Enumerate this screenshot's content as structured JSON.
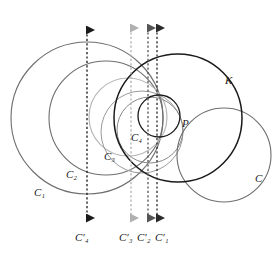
{
  "figure": {
    "width": 279,
    "height": 253,
    "background": "#ffffff"
  },
  "palette": {
    "black": "#1a1a1a",
    "dark_gray": "#444444",
    "mid_gray": "#6e6e6e",
    "gray": "#8a8a8a",
    "light_gray": "#b8b8b8",
    "very_light_gray": "#cfcfcf",
    "white": "#ffffff"
  },
  "labels": [
    {
      "id": "C1",
      "base": "C",
      "sub": "1",
      "prime": false,
      "x": 40,
      "y": 192,
      "color": "#555555"
    },
    {
      "id": "C2",
      "base": "C",
      "sub": "2",
      "prime": false,
      "x": 72,
      "y": 174,
      "color": "#555555"
    },
    {
      "id": "C3",
      "base": "C",
      "sub": "3",
      "prime": false,
      "x": 110,
      "y": 156,
      "color": "#8a8a8a"
    },
    {
      "id": "C4",
      "base": "C",
      "sub": "4",
      "prime": false,
      "x": 136,
      "y": 137,
      "color": "#1a1a1a"
    },
    {
      "id": "K",
      "base": "K",
      "sub": "",
      "prime": false,
      "x": 229,
      "y": 80,
      "color": "#1a1a1a"
    },
    {
      "id": "C",
      "base": "C",
      "sub": "",
      "prime": false,
      "x": 259,
      "y": 178,
      "color": "#1a1a1a"
    },
    {
      "id": "P",
      "base": "P",
      "sub": "",
      "prime": false,
      "x": 185,
      "y": 124,
      "color": "#1a1a1a"
    },
    {
      "id": "C4prime",
      "base": "C",
      "sub": "4",
      "prime": true,
      "x": 81,
      "y": 238,
      "color": "#1a1a1a"
    },
    {
      "id": "C3prime",
      "base": "C",
      "sub": "3",
      "prime": true,
      "x": 125,
      "y": 238,
      "color": "#8a8a8a"
    },
    {
      "id": "C2prime",
      "base": "C",
      "sub": "2",
      "prime": true,
      "x": 143,
      "y": 238,
      "color": "#444444"
    },
    {
      "id": "C1prime",
      "base": "C",
      "sub": "1",
      "prime": true,
      "x": 160,
      "y": 238,
      "color": "#1a1a1a"
    }
  ],
  "label_text": {
    "C1": "C₁",
    "C2": "C₂",
    "C3": "C₃",
    "C4": "C₄",
    "K": "K",
    "C": "C",
    "P": "P",
    "C4prime": "C′₄",
    "C3prime": "C′₃",
    "C2prime": "C′₂",
    "C1prime": "C′₁"
  },
  "circles": [
    {
      "id": "C1",
      "cx": 87,
      "cy": 118,
      "r": 76,
      "stroke": "#6e6e6e",
      "width": 1.1
    },
    {
      "id": "C2",
      "cx": 106,
      "cy": 118,
      "r": 57,
      "stroke": "#6e6e6e",
      "width": 1.1
    },
    {
      "id": "C3",
      "cx": 128,
      "cy": 117,
      "r": 39,
      "stroke": "#b8b8b8",
      "width": 1.2
    },
    {
      "id": "C4",
      "cx": 159,
      "cy": 116,
      "r": 21,
      "stroke": "#1a1a1a",
      "width": 1.3
    },
    {
      "id": "K",
      "cx": 178,
      "cy": 118,
      "r": 64,
      "stroke": "#1a1a1a",
      "width": 1.5
    },
    {
      "id": "C",
      "cx": 224,
      "cy": 155,
      "r": 47,
      "stroke": "#6e6e6e",
      "width": 1.1
    },
    {
      "id": "K-inner-arc-a",
      "cx": 150,
      "cy": 130,
      "r": 33,
      "stroke": "#8a8a8a",
      "width": 1.0
    },
    {
      "id": "K-inner-arc-b",
      "cx": 142,
      "cy": 132,
      "r": 41,
      "stroke": "#9a9a9a",
      "width": 1.0
    }
  ],
  "image_lines": [
    {
      "id": "C4prime-line",
      "x": 87,
      "y_top": 24,
      "y_bottom": 224,
      "color": "#1a1a1a",
      "label": "C4prime"
    },
    {
      "id": "C3prime-line",
      "x": 131,
      "y_top": 22,
      "y_bottom": 224,
      "color": "#b0b0b0",
      "label": "C3prime"
    },
    {
      "id": "C2prime-line",
      "x": 148,
      "y_top": 22,
      "y_bottom": 224,
      "color": "#555555",
      "label": "C2prime"
    },
    {
      "id": "C1prime-line",
      "x": 157,
      "y_top": 22,
      "y_bottom": 224,
      "color": "#2b2b2b",
      "label": "C1prime"
    }
  ],
  "points": [
    {
      "id": "P",
      "x": 180,
      "y": 120,
      "label": "P"
    }
  ]
}
